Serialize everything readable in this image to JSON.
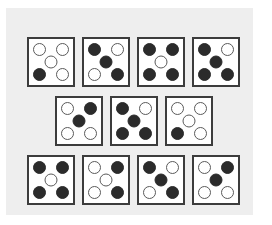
{
  "figure": {
    "kind": "dice-pattern-grid",
    "page_background": "#ffffff",
    "panel_background": "#eeeeee",
    "card_background": "#ffffff",
    "card_border_color": "#3c3c3c",
    "pip_filled_color": "#2b2b2b",
    "pip_open_fill": "#ffffff",
    "pip_open_border_color": "#5a5a5a",
    "card_count": 11,
    "pip_positions": [
      "tl",
      "tr",
      "c",
      "bl",
      "br"
    ]
  },
  "rows": [
    {
      "name": "top-row",
      "cards": [
        {
          "name": "card-1",
          "pips": {
            "tl": "open",
            "tr": "open",
            "c": "open",
            "bl": "filled",
            "br": "open"
          },
          "filled_count": 1
        },
        {
          "name": "card-2",
          "pips": {
            "tl": "filled",
            "tr": "open",
            "c": "filled",
            "bl": "open",
            "br": "filled"
          },
          "filled_count": 3
        },
        {
          "name": "card-3",
          "pips": {
            "tl": "filled",
            "tr": "filled",
            "c": "open",
            "bl": "filled",
            "br": "filled"
          },
          "filled_count": 4
        },
        {
          "name": "card-4",
          "pips": {
            "tl": "filled",
            "tr": "open",
            "c": "filled",
            "bl": "filled",
            "br": "filled"
          },
          "filled_count": 4
        }
      ]
    },
    {
      "name": "middle-row",
      "cards": [
        {
          "name": "card-5",
          "pips": {
            "tl": "open",
            "tr": "filled",
            "c": "filled",
            "bl": "open",
            "br": "open"
          },
          "filled_count": 2
        },
        {
          "name": "card-6",
          "pips": {
            "tl": "filled",
            "tr": "open",
            "c": "filled",
            "bl": "filled",
            "br": "filled"
          },
          "filled_count": 4
        },
        {
          "name": "card-7",
          "pips": {
            "tl": "open",
            "tr": "open",
            "c": "open",
            "bl": "filled",
            "br": "open"
          },
          "filled_count": 1
        }
      ]
    },
    {
      "name": "bottom-row",
      "cards": [
        {
          "name": "card-8",
          "pips": {
            "tl": "filled",
            "tr": "filled",
            "c": "open",
            "bl": "filled",
            "br": "filled"
          },
          "filled_count": 4
        },
        {
          "name": "card-9",
          "pips": {
            "tl": "open",
            "tr": "filled",
            "c": "open",
            "bl": "open",
            "br": "filled"
          },
          "filled_count": 2
        },
        {
          "name": "card-10",
          "pips": {
            "tl": "filled",
            "tr": "open",
            "c": "filled",
            "bl": "open",
            "br": "filled"
          },
          "filled_count": 3
        },
        {
          "name": "card-11",
          "pips": {
            "tl": "open",
            "tr": "filled",
            "c": "filled",
            "bl": "open",
            "br": "open"
          },
          "filled_count": 2
        }
      ]
    }
  ]
}
